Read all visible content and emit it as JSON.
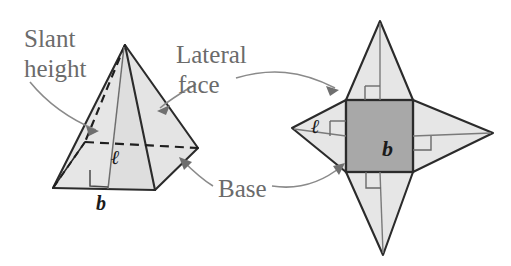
{
  "figure": {
    "labels": {
      "slant_height_line1": "Slant",
      "slant_height_line2": "height",
      "lateral_face_line1": "Lateral",
      "lateral_face_line2": "face",
      "base": "Base"
    },
    "variables": {
      "slant_height_symbol": "ℓ",
      "base_symbol": "b"
    },
    "colors": {
      "base_fill": "#a8a8a8",
      "lateral_fill": "#e2e2e2",
      "net_square_fill": "#a8a8a8",
      "net_triangle_fill": "#e3e3e3",
      "outline": "#2b2b2b",
      "label_text": "#6b6b6b",
      "variable_text": "#1a1a1a",
      "leader_line": "#8a8a8a",
      "background": "#ffffff"
    },
    "pyramid": {
      "apex": [
        125,
        45
      ],
      "base_front_left": [
        53,
        188
      ],
      "base_front_right": [
        155,
        190
      ],
      "base_right": [
        198,
        148
      ],
      "base_back_hidden": [
        85,
        142
      ],
      "hidden_edges": "dashed",
      "right_angle_marker": true
    },
    "net": {
      "square": {
        "x": 346,
        "y": 100,
        "width": 67,
        "height": 72
      },
      "triangle_tips": {
        "top": [
          380,
          21
        ],
        "bottom": [
          383,
          255
        ],
        "left": [
          292,
          128
        ],
        "right": [
          493,
          133
        ]
      },
      "right_angle_markers": 4
    }
  }
}
